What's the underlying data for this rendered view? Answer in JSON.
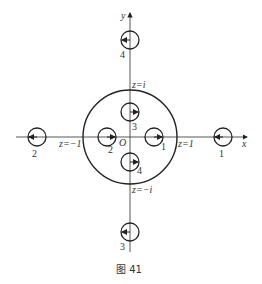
{
  "figure": {
    "caption": "图 41",
    "axes": {
      "x_label": "x",
      "y_label": "y",
      "origin_label": "O"
    },
    "contour": {
      "description": "big circle enclosing inner loops",
      "labels": {
        "top": "z=i",
        "bottom": "z=−i",
        "left": "z=−1",
        "right": "z=1"
      }
    },
    "inner_loops": [
      {
        "id": "1",
        "label": "1",
        "position": "right of origin",
        "arrow": "right"
      },
      {
        "id": "2",
        "label": "2",
        "position": "left of origin",
        "arrow": "right"
      },
      {
        "id": "3",
        "label": "3",
        "position": "above origin",
        "arrow": "right"
      },
      {
        "id": "4",
        "label": "4",
        "position": "below origin",
        "arrow": "right"
      }
    ],
    "outer_loops": [
      {
        "id": "1",
        "label": "1",
        "position": "far right on x-axis",
        "arrow": "left"
      },
      {
        "id": "2",
        "label": "2",
        "position": "far left on x-axis",
        "arrow": "left"
      },
      {
        "id": "3",
        "label": "3",
        "position": "far bottom on y-axis",
        "arrow": "left"
      },
      {
        "id": "4",
        "label": "4",
        "position": "far top on y-axis",
        "arrow": "left"
      }
    ]
  }
}
